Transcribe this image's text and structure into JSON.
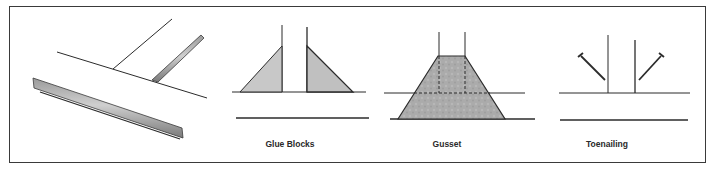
{
  "figure": {
    "panels": [
      {
        "id": "perspective",
        "label": ""
      },
      {
        "id": "glue-blocks",
        "label": "Glue Blocks",
        "center_x": 290
      },
      {
        "id": "gusset",
        "label": "Gusset",
        "center_x": 447
      },
      {
        "id": "toenailing",
        "label": "Toenailing",
        "center_x": 607
      }
    ],
    "colors": {
      "line": "#2b2b2b",
      "fill_light": "#c8c8c8",
      "fill_dark": "#a9a9a9",
      "frame": "#3a3a3a"
    }
  }
}
